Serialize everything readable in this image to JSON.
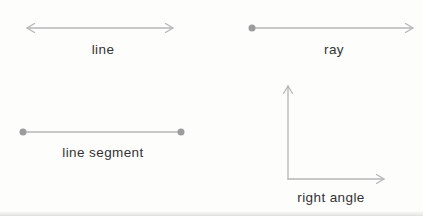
{
  "page": {
    "background": "#fdfdfc"
  },
  "colors": {
    "stroke": "#b5b5b5",
    "dot": "#9c9c9c",
    "text": "#333333"
  },
  "figures": [
    {
      "id": "line",
      "label": "line",
      "type": "double-arrow",
      "x1": 27,
      "y1": 28,
      "x2": 173,
      "y2": 28,
      "label_x": 103,
      "label_y": 54
    },
    {
      "id": "ray",
      "label": "ray",
      "type": "dot-arrow",
      "x1": 252,
      "y1": 28,
      "x2": 413,
      "y2": 28,
      "label_x": 334,
      "label_y": 54
    },
    {
      "id": "line-segment",
      "label": "line segment",
      "type": "dot-dot",
      "x1": 23,
      "y1": 132,
      "x2": 181,
      "y2": 132,
      "label_x": 103,
      "label_y": 157
    },
    {
      "id": "right-angle",
      "label": "right angle",
      "type": "right-angle",
      "corner_x": 288,
      "corner_y": 179,
      "arm_up_y": 86,
      "arm_right_x": 384,
      "label_x": 331,
      "label_y": 202
    }
  ]
}
